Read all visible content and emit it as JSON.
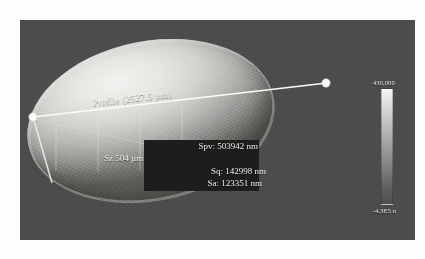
{
  "view": {
    "name": "surface-profile-render",
    "background_color": "#4b4b4b",
    "page_background": "#fdfdfb"
  },
  "profile": {
    "label": "Profile (2527.5 µm)",
    "length_value": "2527.5",
    "length_unit": "µm",
    "start_marker": "profile-start-point",
    "end_marker": "profile-end-point"
  },
  "statistics": {
    "spv": "Spv: 503942 nm",
    "sz": "Sz 504 µm",
    "sq": "Sq: 142998 nm",
    "sa": "Sa: 123351 nm"
  },
  "colorbar": {
    "max_label": "430,000",
    "min_label": "-4.3E5 n",
    "gradient_top_color": "#f6f6f4",
    "gradient_bottom_color": "#4f4f4e"
  }
}
